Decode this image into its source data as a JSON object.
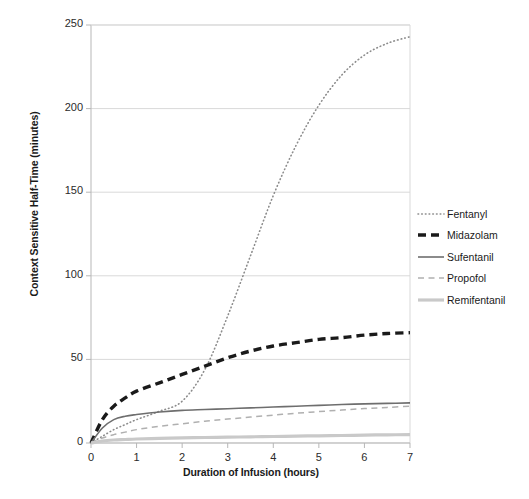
{
  "chart_data": {
    "type": "line",
    "title": "",
    "xlabel": "Duration of Infusion (hours)",
    "ylabel": "Context Sensitive Half-Time (minutes)",
    "xlim": [
      0,
      7
    ],
    "ylim": [
      0,
      250
    ],
    "xticks": [
      "0",
      "1",
      "2",
      "3",
      "4",
      "5",
      "6",
      "7"
    ],
    "yticks": [
      "0",
      "50",
      "100",
      "150",
      "200",
      "250"
    ],
    "grid": "horizontal",
    "legend_position": "right",
    "x": [
      0,
      0.25,
      0.5,
      0.75,
      1,
      1.5,
      2,
      2.5,
      3,
      3.5,
      4,
      4.5,
      5,
      5.5,
      6,
      6.5,
      7
    ],
    "series": [
      {
        "name": "Fentanyl",
        "style": "dotted",
        "color": "#8c8c8c",
        "width": 1.6,
        "values": [
          0,
          4,
          8,
          11,
          14,
          19,
          25,
          44,
          76,
          112,
          148,
          178,
          202,
          220,
          232,
          239,
          243
        ]
      },
      {
        "name": "Midazolam",
        "style": "dashed",
        "color": "#1a1a1a",
        "width": 3.4,
        "values": [
          0,
          14,
          22,
          27,
          31,
          36,
          41,
          46,
          51,
          55,
          58,
          60,
          62,
          63,
          64.5,
          65.5,
          66
        ]
      },
      {
        "name": "Sufentanil",
        "style": "solid",
        "color": "#6e6e6e",
        "width": 1.6,
        "values": [
          0,
          9,
          14,
          16,
          17,
          18.5,
          19.5,
          20,
          20.5,
          21,
          21.5,
          22,
          22.5,
          23,
          23.4,
          23.7,
          24
        ]
      },
      {
        "name": "Propofol",
        "style": "dashed-thin",
        "color": "#b0b0b0",
        "width": 1.5,
        "values": [
          0,
          3,
          5,
          6.5,
          8,
          10,
          11.5,
          13,
          14.3,
          15.5,
          16.7,
          17.8,
          18.8,
          19.7,
          20.6,
          21.3,
          22
        ]
      },
      {
        "name": "Remifentanil",
        "style": "solid-thick",
        "color": "#c9c9c9",
        "width": 3.2,
        "values": [
          0,
          1.2,
          1.8,
          2.1,
          2.4,
          2.8,
          3.1,
          3.3,
          3.5,
          3.7,
          3.9,
          4.1,
          4.3,
          4.5,
          4.7,
          4.9,
          5
        ]
      }
    ]
  },
  "axes": {
    "plot_frame_color": "#b7b7b7",
    "gridline_color": "#d9d9d9"
  },
  "legend": {
    "entries": [
      {
        "label": "Fentanyl"
      },
      {
        "label": "Midazolam"
      },
      {
        "label": "Sufentanil"
      },
      {
        "label": "Propofol"
      },
      {
        "label": "Remifentanil"
      }
    ]
  }
}
